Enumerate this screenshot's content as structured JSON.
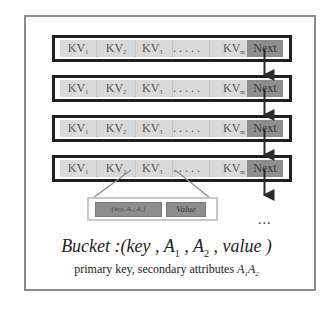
{
  "diagram": {
    "rows": [
      {
        "cells": [
          "KV",
          "KV",
          "KV",
          ". . . . .",
          "KV"
        ],
        "subs": [
          "1",
          "2",
          "3",
          "",
          "m"
        ],
        "next": "Next"
      },
      {
        "cells": [
          "KV",
          "KV",
          "KV",
          ". . . . .",
          "KV"
        ],
        "subs": [
          "1",
          "2",
          "3",
          "",
          "m"
        ],
        "next": "Next"
      },
      {
        "cells": [
          "KV",
          "KV",
          "KV",
          ". . . . .",
          "KV"
        ],
        "subs": [
          "1",
          "2",
          "3",
          "",
          "m"
        ],
        "next": "Next"
      },
      {
        "cells": [
          "KV",
          "KV",
          "KV",
          ". . . . .",
          "KV"
        ],
        "subs": [
          "1",
          "2",
          "3",
          "",
          "m"
        ],
        "next": "Next"
      }
    ],
    "detail": {
      "key_label": "(key, A₁, A₂)",
      "value_label": "Value"
    },
    "continuation": "...",
    "formula": {
      "prefix": "Bucket :(key , A",
      "sub1": "1",
      "mid": " , A",
      "sub2": "2",
      "suffix": " , value )"
    },
    "caption": {
      "text": "primary key, secondary attributes ",
      "attr": "A",
      "sub1": "1",
      "sub2": "2"
    },
    "colors": {
      "cell": "#d9d9d9",
      "next": "#8e8e8e",
      "row_border": "#1e1e1e",
      "frame_border": "#8c8c8c"
    }
  }
}
